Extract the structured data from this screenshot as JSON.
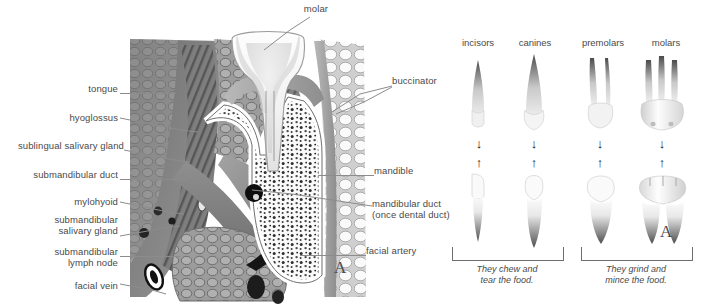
{
  "figure": {
    "background": "#ffffff",
    "label_color": "#4a4a4a",
    "leader_color": "#8c8c8c"
  },
  "section_panel": {
    "marker": "A",
    "labels_left": [
      {
        "id": "tongue",
        "text": "tongue"
      },
      {
        "id": "hyoglossus",
        "text": "hyoglossus"
      },
      {
        "id": "sublingual-salivary-gland",
        "text": "sublingual salivary gland"
      },
      {
        "id": "submandibular-duct",
        "text": "submandibular duct"
      },
      {
        "id": "mylohyoid",
        "text": "mylohyoid"
      },
      {
        "id": "submandibular-salivary-gland",
        "text": "submandibular\nsalivary gland"
      },
      {
        "id": "submandibular-lymph-node",
        "text": "submandibular\nlymph node"
      },
      {
        "id": "facial-vein",
        "text": "facial vein"
      }
    ],
    "labels_right": [
      {
        "id": "buccinator",
        "text": "buccinator"
      },
      {
        "id": "mandible",
        "text": "mandible"
      },
      {
        "id": "mandibular-duct",
        "text": "mandibular duct\n(once dental duct)"
      },
      {
        "id": "facial-artery",
        "text": "facial artery"
      }
    ],
    "labels_top": [
      {
        "id": "molar",
        "text": "molar"
      }
    ]
  },
  "teeth_panel": {
    "marker": "A",
    "columns": [
      {
        "id": "incisors",
        "heading": "incisors",
        "roots": 1,
        "crown": "chisel"
      },
      {
        "id": "canines",
        "heading": "canines",
        "roots": 1,
        "crown": "point"
      },
      {
        "id": "premolars",
        "heading": "premolars",
        "roots": 2,
        "crown": "cusp2"
      },
      {
        "id": "molars",
        "heading": "molars",
        "roots": 3,
        "crown": "cusp4"
      }
    ],
    "arrow_down": "↓",
    "arrow_up": "↑",
    "captions": [
      {
        "id": "chew-tear",
        "text": "They chew and\ntear the food.",
        "covers": [
          "incisors",
          "canines"
        ]
      },
      {
        "id": "grind-mince",
        "text": "They grind and\nmince the food.",
        "covers": [
          "premolars",
          "molars"
        ]
      }
    ]
  }
}
